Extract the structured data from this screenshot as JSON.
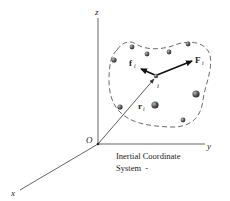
{
  "diagram": {
    "axes": {
      "z_label": "z",
      "y_label": "y",
      "x_label": "x",
      "origin_label": "O"
    },
    "vectors": {
      "position": {
        "symbol": "r",
        "subscript": "i"
      },
      "external_force": {
        "symbol": "F",
        "subscript": "i"
      },
      "internal_force": {
        "symbol": "f",
        "subscript": "i"
      }
    },
    "particle_label": "i",
    "caption": {
      "line1": "Inertial Coordinate",
      "line2": "System  -"
    },
    "colors": {
      "line": "#333333",
      "particle": "#555555",
      "text": "#222222"
    }
  }
}
